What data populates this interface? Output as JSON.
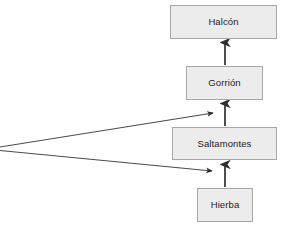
{
  "diagram": {
    "type": "food-chain-flow",
    "width": 291,
    "height": 229,
    "background_color": "#ffffff",
    "node_fill_color": "#ececec",
    "node_border_color": "#a8a8a8",
    "node_text_color": "#1c1c1c",
    "edge_color": "#3a3a3a",
    "nodes": [
      {
        "id": "halcon",
        "label": "Halcón",
        "x": 170,
        "y": 5,
        "w": 107,
        "h": 34
      },
      {
        "id": "gorrion",
        "label": "Gorrión",
        "x": 186,
        "y": 66,
        "w": 77,
        "h": 34
      },
      {
        "id": "saltamontes",
        "label": "Saltamontes",
        "x": 172,
        "y": 127,
        "w": 105,
        "h": 33
      },
      {
        "id": "hierba",
        "label": "Hierba",
        "x": 197,
        "y": 188,
        "w": 56,
        "h": 34
      }
    ],
    "edges": [
      {
        "id": "edge-gorrion-halcon",
        "from": "gorrion",
        "to": "halcon",
        "kind": "vertical-up"
      },
      {
        "id": "edge-saltamontes-gorrion",
        "from": "saltamontes",
        "to": "gorrion",
        "kind": "vertical-up"
      },
      {
        "id": "edge-hierba-saltamontes",
        "from": "hierba",
        "to": "saltamontes",
        "kind": "vertical-up"
      },
      {
        "id": "edge-offscreen-upper",
        "from": "offscreen-left",
        "to": "gorrion-inflow",
        "kind": "diagonal-right"
      },
      {
        "id": "edge-offscreen-lower",
        "from": "offscreen-left",
        "to": "saltamontes-inflow",
        "kind": "diagonal-right"
      }
    ]
  }
}
